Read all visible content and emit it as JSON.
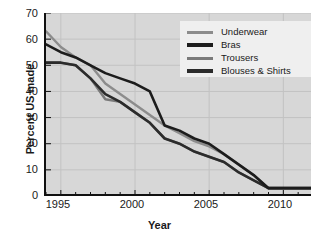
{
  "chart_data": {
    "type": "line",
    "title": "",
    "xlabel": "Year",
    "ylabel": "Percent US made",
    "xlim": [
      1994,
      2012
    ],
    "ylim": [
      0,
      70
    ],
    "yticks": [
      0,
      10,
      20,
      30,
      40,
      50,
      60,
      70
    ],
    "xticks": [
      1995,
      2000,
      2005,
      2010
    ],
    "xticks_minor_step": 1,
    "grid": true,
    "legend_position": "top-right",
    "x": [
      1994,
      1995,
      1996,
      1997,
      1998,
      1999,
      2000,
      2001,
      2002,
      2003,
      2004,
      2005,
      2006,
      2007,
      2008,
      2009,
      2010,
      2011,
      2012
    ],
    "series": [
      {
        "name": "Underwear",
        "color": "#8c8c8c",
        "values": [
          63,
          57,
          53,
          50,
          43,
          39,
          35,
          31,
          27,
          24,
          21,
          19,
          16,
          12,
          8,
          3,
          3,
          3,
          3
        ]
      },
      {
        "name": "Bras",
        "color": "#1c1c1c",
        "values": [
          58,
          55,
          53,
          50,
          47,
          45,
          43,
          40,
          27,
          25,
          22,
          20,
          16,
          12,
          8,
          3,
          3,
          3,
          3
        ]
      },
      {
        "name": "Trousers",
        "color": "#7a7a7a",
        "values": [
          51,
          51,
          50,
          45,
          37,
          36,
          32,
          28,
          22,
          20,
          17,
          15,
          13,
          9,
          6,
          3,
          3,
          3,
          3
        ]
      },
      {
        "name": "Blouses & Shirts",
        "color": "#2b2b2b",
        "values": [
          51,
          51,
          50,
          45,
          39,
          36,
          32,
          28,
          22,
          20,
          17,
          15,
          13,
          9,
          6,
          3,
          3,
          3,
          3
        ]
      }
    ]
  },
  "axis": {
    "ylabel": "Percent US made",
    "xlabel": "Year",
    "yticks": [
      "70",
      "60",
      "50",
      "40",
      "30",
      "20",
      "10",
      "0"
    ],
    "xticks": [
      "1995",
      "2000",
      "2005",
      "2010"
    ]
  },
  "legend": {
    "items": [
      {
        "label": "Underwear",
        "color": "#8c8c8c"
      },
      {
        "label": "Bras",
        "color": "#1c1c1c"
      },
      {
        "label": "Trousers",
        "color": "#7a7a7a"
      },
      {
        "label": "Blouses & Shirts",
        "color": "#2b2b2b"
      }
    ]
  }
}
